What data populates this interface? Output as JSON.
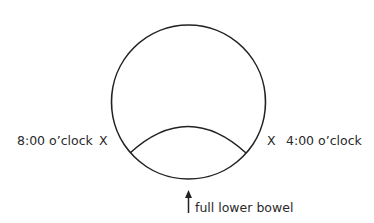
{
  "diagram": {
    "left_label": "8:00 o’clock",
    "left_marker": "X",
    "right_marker": "X",
    "right_label": "4:00 o’clock",
    "bottom_label": "full lower bowel"
  }
}
